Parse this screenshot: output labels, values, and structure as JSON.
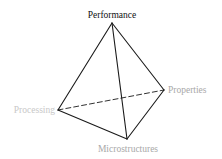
{
  "diagram": {
    "type": "tetrahedron",
    "vertices": [
      {
        "id": "performance",
        "label": "Performance",
        "color": "#111111"
      },
      {
        "id": "processing",
        "label": "Processing",
        "color": "#c8c8c8"
      },
      {
        "id": "properties",
        "label": "Properties",
        "color": "#a8a8a8"
      },
      {
        "id": "microstructures",
        "label": "Microstructures",
        "color": "#a8a8a8"
      }
    ],
    "edges": [
      {
        "from": "performance",
        "to": "processing",
        "style": "solid"
      },
      {
        "from": "performance",
        "to": "properties",
        "style": "solid"
      },
      {
        "from": "performance",
        "to": "microstructures",
        "style": "solid"
      },
      {
        "from": "processing",
        "to": "microstructures",
        "style": "solid"
      },
      {
        "from": "microstructures",
        "to": "properties",
        "style": "solid"
      },
      {
        "from": "processing",
        "to": "properties",
        "style": "dashed"
      }
    ]
  }
}
